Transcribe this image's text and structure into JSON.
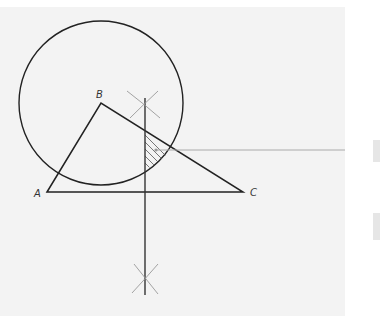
{
  "diagram": {
    "title": "",
    "labels": {
      "A": "A",
      "B": "B",
      "C": "C"
    },
    "points": {
      "A": [
        47,
        192
      ],
      "B": [
        101,
        103
      ],
      "C": [
        243,
        192
      ]
    },
    "circle": {
      "center": [
        101,
        103
      ],
      "radius": 82
    },
    "perpendicular_bisector_x": 145,
    "colors": {
      "panel": "#f3f3f3",
      "stroke": "#222222",
      "construction": "#999999",
      "leader": "#aaaaaa",
      "stub": "#e6e6e6"
    }
  }
}
